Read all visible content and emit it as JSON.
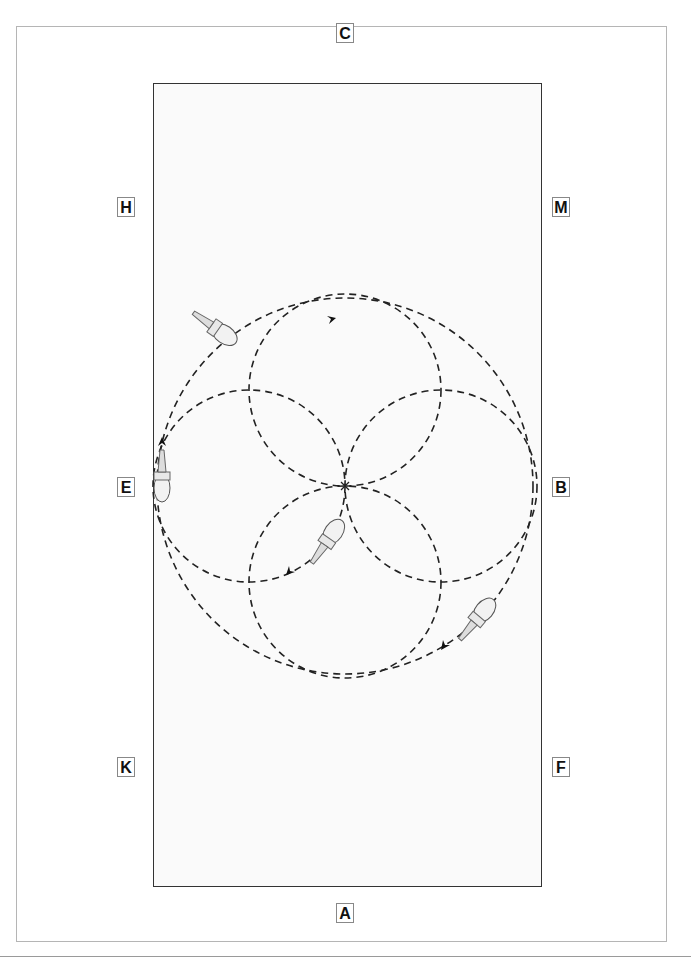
{
  "diagram": {
    "type": "dressage-arena-figure",
    "arena": {
      "short_side_letters": [
        "C",
        "A"
      ],
      "long_side_letters_left": [
        "H",
        "E",
        "K"
      ],
      "long_side_letters_right": [
        "M",
        "B",
        "F"
      ]
    },
    "markers": [
      {
        "id": "C",
        "label": "C"
      },
      {
        "id": "H",
        "label": "H"
      },
      {
        "id": "M",
        "label": "M"
      },
      {
        "id": "E",
        "label": "E"
      },
      {
        "id": "B",
        "label": "B"
      },
      {
        "id": "K",
        "label": "K"
      },
      {
        "id": "F",
        "label": "F"
      },
      {
        "id": "A",
        "label": "A"
      }
    ],
    "figure": {
      "description": "Large circle with four small circles (cloverleaf) meeting at center X",
      "large_circle": {
        "cx": 345,
        "cy": 486,
        "r": 188
      },
      "small_circles": [
        {
          "cx": 345,
          "cy": 390,
          "r": 96
        },
        {
          "cx": 249,
          "cy": 486,
          "r": 96
        },
        {
          "cx": 441,
          "cy": 486,
          "r": 96
        },
        {
          "cx": 345,
          "cy": 582,
          "r": 96
        }
      ],
      "horses": 4,
      "direction_arrows": 5
    }
  }
}
